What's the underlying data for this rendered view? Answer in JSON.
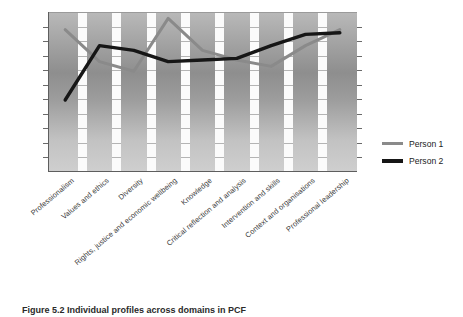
{
  "figure": {
    "caption": "Figure 5.2  Individual profiles across domains in PCF"
  },
  "legend": {
    "position": "right",
    "items": [
      {
        "label": "Person 1",
        "color": "#8a8a8a"
      },
      {
        "label": "Person 2",
        "color": "#161616"
      }
    ]
  },
  "chart_data": {
    "type": "line",
    "title": "",
    "xlabel": "",
    "ylabel": "",
    "ylim": [
      0,
      10
    ],
    "grid": true,
    "categories": [
      "Professionalism",
      "Values and ethics",
      "Diversity",
      "Rights, justice and economic wellbeing",
      "Knowledge",
      "Critical reflection and analysis",
      "Intervention and skills",
      "Context and organisations",
      "Professional leadership"
    ],
    "series": [
      {
        "name": "Person 1",
        "color": "#8a8a8a",
        "values": [
          8.9,
          6.9,
          6.3,
          9.6,
          7.6,
          7.0,
          6.6,
          7.9,
          8.9
        ]
      },
      {
        "name": "Person 2",
        "color": "#161616",
        "values": [
          4.5,
          7.9,
          7.6,
          6.9,
          7.0,
          7.1,
          7.9,
          8.6,
          8.7
        ]
      }
    ],
    "yticks": [
      0,
      1,
      2,
      3,
      4,
      5,
      6,
      7,
      8,
      9,
      10
    ],
    "ytick_labels": [
      "",
      "",
      "",
      "",
      "",
      "",
      "",
      "",
      "",
      "",
      ""
    ]
  }
}
